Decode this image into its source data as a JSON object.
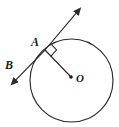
{
  "figure": {
    "width": 119,
    "height": 127,
    "background_color": "#ffffff",
    "ink_color": "#2b2b2b"
  },
  "labels": {
    "point_a": "A",
    "point_b": "B",
    "point_o": "O"
  },
  "geometry": {
    "circle": {
      "center_x": 71.5,
      "center_y": 80.5,
      "radius": 41.5,
      "stroke_color": "#2b2b2b",
      "stroke_width": 1.15
    },
    "tangent_point": {
      "x": 45.0,
      "y": 50.0,
      "label": "A"
    },
    "center_point": {
      "x": 71.0,
      "y": 77.0,
      "label": "O",
      "dot_radius": 1.8
    },
    "tangent_line": {
      "x1": 13.0,
      "y1": 83.0,
      "x2": 79.0,
      "y2": 10.0,
      "arrow_start": true,
      "arrow_end": true
    },
    "radius_segment": {
      "x1": 45.0,
      "y1": 50.0,
      "x2": 71.0,
      "y2": 77.0
    },
    "right_angle_marker": {
      "at_x": 45.0,
      "at_y": 50.0,
      "size": 8.5
    }
  },
  "label_positions": {
    "a": {
      "x": 31,
      "y": 46
    },
    "b": {
      "x": 5,
      "y": 69
    },
    "o": {
      "x": 76,
      "y": 82
    }
  }
}
